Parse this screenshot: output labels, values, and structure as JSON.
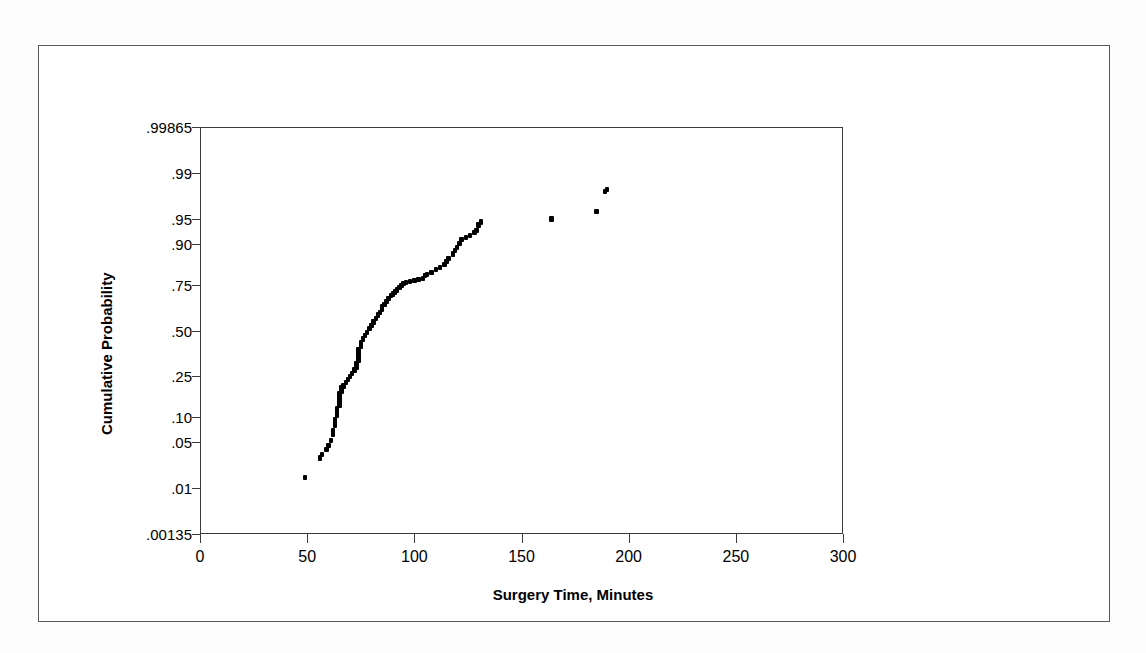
{
  "figure": {
    "background_color": "#ffffff",
    "border_color": "#555a5f",
    "marker_color": "#000000"
  },
  "chart_data": {
    "type": "scatter",
    "title": "",
    "subtitle": "",
    "xlabel": "Surgery Time, Minutes",
    "ylabel": "Cumulative Probability",
    "plot_kind": "normal probability plot",
    "grid": false,
    "legend": null,
    "xlim": [
      0,
      300
    ],
    "xticks": [
      0,
      50,
      100,
      150,
      200,
      250,
      300
    ],
    "xtick_labels": [
      "0",
      "50",
      "100",
      "150",
      "200",
      "250",
      "300"
    ],
    "yscale": "probit",
    "ylim": [
      0.00135,
      0.99865
    ],
    "yticks": [
      0.00135,
      0.01,
      0.05,
      0.1,
      0.25,
      0.5,
      0.75,
      0.9,
      0.95,
      0.99,
      0.99865
    ],
    "ytick_labels": [
      ".00135",
      ".01",
      ".05",
      ".10",
      ".25",
      ".50",
      ".75",
      ".90",
      ".95",
      ".99",
      ".99865"
    ],
    "series": [
      {
        "name": "Surgery time",
        "marker": "square",
        "color": "#000000",
        "x": [
          49,
          56,
          57,
          59,
          60,
          61,
          62,
          62,
          63,
          63,
          63,
          64,
          64,
          64,
          65,
          65,
          65,
          65,
          65,
          66,
          66,
          66,
          66,
          67,
          67,
          68,
          69,
          70,
          71,
          72,
          73,
          73,
          73,
          74,
          74,
          74,
          74,
          75,
          75,
          76,
          77,
          78,
          79,
          80,
          81,
          82,
          83,
          84,
          85,
          85,
          86,
          87,
          88,
          89,
          90,
          91,
          92,
          93,
          94,
          95,
          96,
          98,
          100,
          102,
          104,
          105,
          106,
          108,
          110,
          112,
          114,
          115,
          116,
          118,
          119,
          120,
          121,
          122,
          124,
          126,
          128,
          129,
          130,
          131,
          164,
          185,
          189,
          190
        ],
        "y": [
          0.015,
          0.03,
          0.034,
          0.04,
          0.045,
          0.052,
          0.062,
          0.07,
          0.08,
          0.088,
          0.095,
          0.105,
          0.115,
          0.125,
          0.135,
          0.145,
          0.155,
          0.165,
          0.175,
          0.185,
          0.19,
          0.195,
          0.2,
          0.205,
          0.21,
          0.22,
          0.235,
          0.25,
          0.265,
          0.28,
          0.295,
          0.305,
          0.315,
          0.33,
          0.35,
          0.37,
          0.39,
          0.41,
          0.43,
          0.45,
          0.47,
          0.49,
          0.51,
          0.53,
          0.55,
          0.57,
          0.59,
          0.605,
          0.62,
          0.635,
          0.65,
          0.665,
          0.68,
          0.695,
          0.705,
          0.715,
          0.725,
          0.735,
          0.745,
          0.755,
          0.76,
          0.765,
          0.77,
          0.775,
          0.78,
          0.79,
          0.795,
          0.805,
          0.815,
          0.825,
          0.835,
          0.845,
          0.855,
          0.87,
          0.88,
          0.89,
          0.9,
          0.91,
          0.915,
          0.92,
          0.925,
          0.93,
          0.94,
          0.945,
          0.95,
          0.96,
          0.98,
          0.981
        ]
      }
    ]
  }
}
